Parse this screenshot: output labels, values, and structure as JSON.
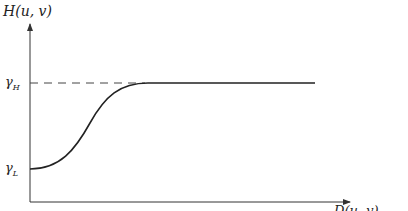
{
  "diagram": {
    "type": "homomorphic-filter-transfer-function",
    "y_axis_label": "H(u, v)",
    "x_axis_label": "D(u, v)",
    "levels": {
      "high": {
        "symbol": "γ",
        "sub": "H"
      },
      "low": {
        "symbol": "γ",
        "sub": "L"
      }
    },
    "colors": {
      "curve": "#222222",
      "axis": "#333333",
      "dashed": "#444444"
    }
  }
}
